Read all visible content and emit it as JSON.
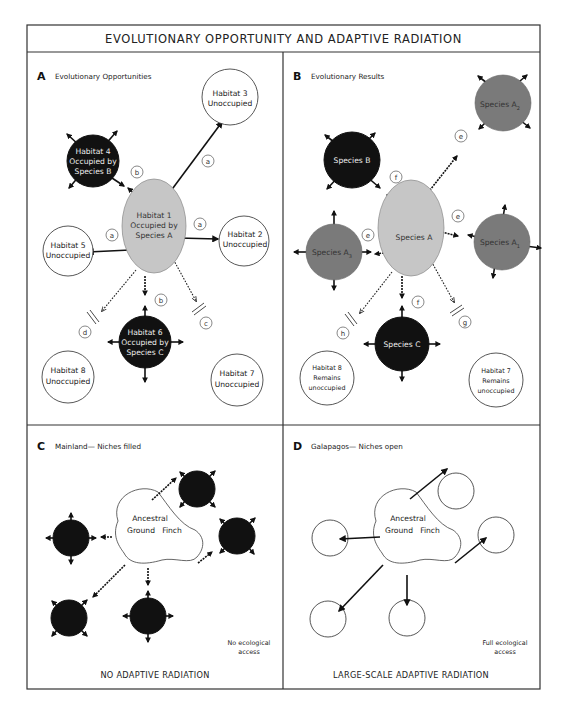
{
  "title": "EVOLUTIONARY OPPORTUNITY AND ADAPTIVE RADIATION",
  "panels": {
    "a": {
      "letter": "A",
      "heading": "Evolutionary Opportunities",
      "habitats": {
        "h1": [
          "Habitat 1",
          "Occupied by",
          "Species A"
        ],
        "h2": [
          "Habitat 2",
          "Unoccupied"
        ],
        "h3": [
          "Habitat 3",
          "Unoccupied"
        ],
        "h4": [
          "Habitat 4",
          "Occupied by",
          "Species B"
        ],
        "h5": [
          "Habitat 5",
          "Unoccupied"
        ],
        "h6": [
          "Habitat 6",
          "Occupied by",
          "Species C"
        ],
        "h7": [
          "Habitat 7",
          "Unoccupied"
        ],
        "h8": [
          "Habitat 8",
          "Unoccupied"
        ]
      },
      "arrow_labels": {
        "to_h3": "a",
        "to_h2": "a",
        "to_h5": "a",
        "to_h4": "b",
        "to_h6": "b",
        "to_h7": "c",
        "to_h8": "d"
      }
    },
    "b": {
      "letter": "B",
      "heading": "Evolutionary Results",
      "nodes": {
        "species_a": "Species A",
        "species_a1": "Species A",
        "species_a1_sub": "1",
        "species_a2": "Species A",
        "species_a2_sub": "2",
        "species_a3": "Species A",
        "species_a3_sub": "3",
        "species_b": "Species B",
        "species_c": "Species C",
        "h8": [
          "Habitat 8",
          "Remains",
          "unoccupied"
        ],
        "h7": [
          "Habitat 7",
          "Remains",
          "unoccupied"
        ]
      },
      "arrow_labels": {
        "to_a2": "e",
        "to_a1": "e",
        "to_a3": "e",
        "to_b": "f",
        "to_c": "f",
        "to_h7": "g",
        "to_h8": "h"
      }
    },
    "c": {
      "letter": "C",
      "heading": "Mainland— Niches filled",
      "center": [
        "Ancestral",
        "Ground",
        "Finch"
      ],
      "note": [
        "No ecological",
        "access"
      ],
      "footer": "NO ADAPTIVE RADIATION"
    },
    "d": {
      "letter": "D",
      "heading": "Galapagos— Niches open",
      "center": [
        "Ancestral",
        "Ground",
        "Finch"
      ],
      "note": [
        "Full ecological",
        "access"
      ],
      "footer": "LARGE-SCALE ADAPTIVE RADIATION"
    }
  },
  "colors": {
    "occupied": "#111111",
    "derived_species": "#7a7a7a",
    "ancestral_species": "#c6c6c6",
    "unoccupied": "#ffffff"
  }
}
